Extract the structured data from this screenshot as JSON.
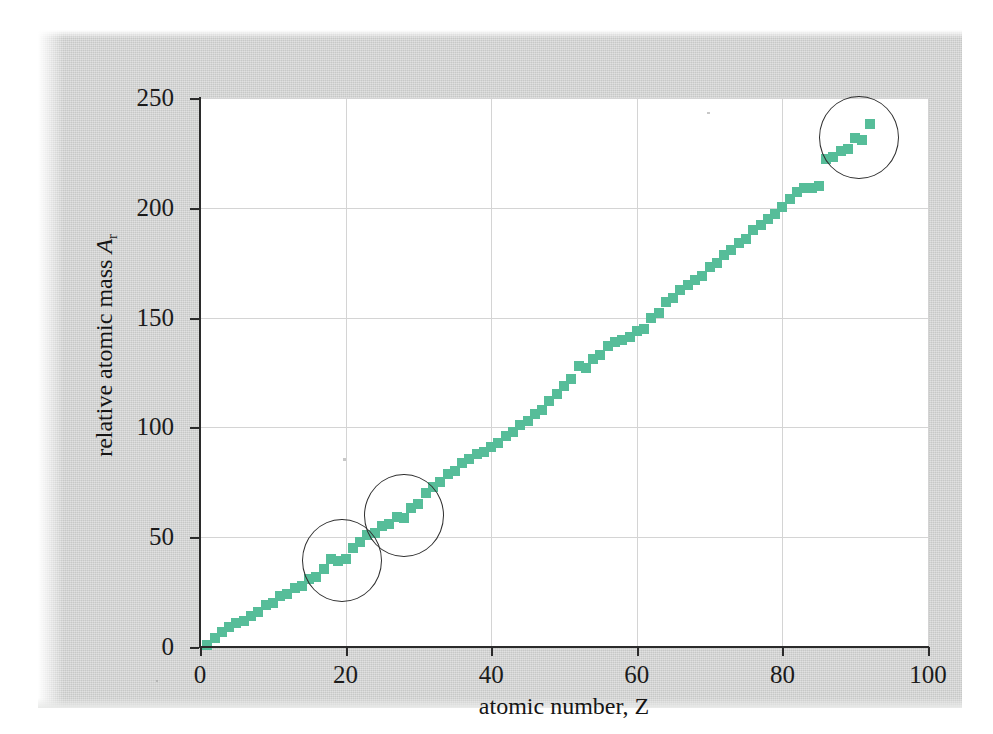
{
  "figure": {
    "background_color": "#cfd0cf",
    "plot_background_color": "#ffffff",
    "marker_color": "#56bd99",
    "axis_color": "#2b2b2b",
    "grid_color": "#d4d4d4",
    "annotation_color": "#2f2f2f"
  },
  "axes": {
    "x_title": "atomic number, Z",
    "y_title_prefix": "relative atomic mass ",
    "y_title_symbol": "A",
    "y_title_subscript": "r",
    "x_ticks": [
      "0",
      "20",
      "40",
      "60",
      "80",
      "100"
    ],
    "y_ticks": [
      "0",
      "50",
      "100",
      "150",
      "200",
      "250"
    ]
  },
  "chart_data": {
    "type": "scatter",
    "title": "",
    "xlabel": "atomic number, Z",
    "ylabel": "relative atomic mass A_r",
    "xlim": [
      0,
      100
    ],
    "ylim": [
      0,
      250
    ],
    "x_ticks": [
      0,
      20,
      40,
      60,
      80,
      100
    ],
    "y_ticks": [
      0,
      50,
      100,
      150,
      200,
      250
    ],
    "grid": true,
    "legend": "none",
    "marker": "square",
    "marker_color": "#56bd99",
    "x": [
      1,
      2,
      3,
      4,
      5,
      6,
      7,
      8,
      9,
      10,
      11,
      12,
      13,
      14,
      15,
      16,
      17,
      18,
      19,
      20,
      21,
      22,
      23,
      24,
      25,
      26,
      27,
      28,
      29,
      30,
      31,
      32,
      33,
      34,
      35,
      36,
      37,
      38,
      39,
      40,
      41,
      42,
      43,
      44,
      45,
      46,
      47,
      48,
      49,
      50,
      51,
      52,
      53,
      54,
      55,
      56,
      57,
      58,
      59,
      60,
      61,
      62,
      63,
      64,
      65,
      66,
      67,
      68,
      69,
      70,
      71,
      72,
      73,
      74,
      75,
      76,
      77,
      78,
      79,
      80,
      81,
      82,
      83,
      84,
      85,
      86,
      87,
      88,
      89,
      90,
      91,
      92
    ],
    "y": [
      1,
      4,
      7,
      9,
      11,
      12,
      14,
      16,
      19,
      20,
      23,
      24,
      27,
      28,
      31,
      32,
      35.5,
      40,
      39,
      40,
      45,
      48,
      51,
      52,
      55,
      56,
      59,
      58.7,
      63.5,
      65,
      70,
      73,
      75,
      79,
      80,
      84,
      85.5,
      88,
      89,
      91,
      93,
      96,
      98,
      101,
      103,
      106,
      108,
      112,
      115,
      119,
      122,
      128,
      127,
      131,
      133,
      137,
      139,
      140,
      141,
      144,
      145,
      150,
      152,
      157,
      159,
      162.5,
      165,
      167,
      169,
      173,
      175,
      178.5,
      181,
      184,
      186,
      190,
      192,
      195,
      197,
      200.5,
      204,
      207,
      209,
      209,
      210,
      222,
      223,
      226,
      227,
      232,
      231,
      238
    ],
    "series": [
      {
        "name": "relative atomic mass",
        "values": [
          1,
          4,
          7,
          9,
          11,
          12,
          14,
          16,
          19,
          20,
          23,
          24,
          27,
          28,
          31,
          32,
          35.5,
          40,
          39,
          40,
          45,
          48,
          51,
          52,
          55,
          56,
          59,
          58.7,
          63.5,
          65,
          70,
          73,
          75,
          79,
          80,
          84,
          85.5,
          88,
          89,
          91,
          93,
          96,
          98,
          101,
          103,
          106,
          108,
          112,
          115,
          119,
          122,
          128,
          127,
          131,
          133,
          137,
          139,
          140,
          141,
          144,
          145,
          150,
          152,
          157,
          159,
          162.5,
          165,
          167,
          169,
          173,
          175,
          178.5,
          181,
          184,
          186,
          190,
          192,
          195,
          197,
          200.5,
          204,
          207,
          209,
          209,
          210,
          222,
          223,
          226,
          227,
          232,
          231,
          238
        ]
      }
    ],
    "annotations": [
      {
        "name": "circle-argon-potassium",
        "shape": "circle",
        "cx": 19.5,
        "cy": 39.5,
        "r_x": 5.5,
        "r_y": 19
      },
      {
        "name": "circle-cobalt-nickel",
        "shape": "circle",
        "cx": 28.0,
        "cy": 60.0,
        "r_x": 5.5,
        "r_y": 19
      },
      {
        "name": "circle-protactinium-uranium",
        "shape": "circle",
        "cx": 90.5,
        "cy": 232.0,
        "r_x": 5.5,
        "r_y": 19
      }
    ]
  }
}
